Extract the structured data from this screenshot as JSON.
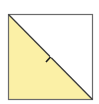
{
  "diagram": {
    "shape": "square-split-diagonal",
    "square": {
      "x": 8,
      "y": 14,
      "width": 85,
      "height": 86
    },
    "colors": {
      "border": "#6b6b6b",
      "diagonal": "#3a3a3a",
      "filled_triangle": "#fbf0a6",
      "empty_triangle": "#ffffff",
      "tick_mark": "#1f1f1f"
    },
    "filled_region": "lower-left triangle",
    "tick_mark": {
      "cx": 50,
      "cy": 57
    }
  }
}
